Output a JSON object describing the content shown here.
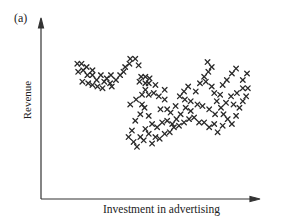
{
  "chart_data": {
    "type": "scatter",
    "title": "",
    "panel_label": "(a)",
    "xlabel": "Investment in advertising",
    "ylabel": "Revenue",
    "marker": "x",
    "grid": false,
    "legend": null,
    "axis_ticks": false,
    "xlim": [
      0,
      100
    ],
    "ylim": [
      0,
      100
    ],
    "points": [
      [
        23,
        83
      ],
      [
        28,
        83
      ],
      [
        34,
        81
      ],
      [
        41,
        79
      ],
      [
        24,
        78
      ],
      [
        30,
        79
      ],
      [
        35,
        76
      ],
      [
        41,
        76
      ],
      [
        29,
        72
      ],
      [
        36,
        71
      ],
      [
        41,
        70
      ],
      [
        46,
        73
      ],
      [
        51,
        76
      ],
      [
        47,
        69
      ],
      [
        53,
        68
      ],
      [
        55,
        72
      ],
      [
        58,
        74
      ],
      [
        62,
        71
      ],
      [
        64,
        69
      ],
      [
        63,
        76
      ],
      [
        69,
        73
      ],
      [
        74,
        76
      ],
      [
        78,
        78
      ],
      [
        80,
        81
      ],
      [
        85,
        83
      ],
      [
        86,
        86
      ],
      [
        92,
        86
      ],
      [
        96,
        82
      ],
      [
        99,
        75
      ],
      [
        97,
        72
      ],
      [
        104,
        75
      ],
      [
        104,
        71
      ],
      [
        109,
        74
      ],
      [
        108,
        71
      ],
      [
        104,
        67
      ],
      [
        116,
        70
      ],
      [
        100,
        64
      ],
      [
        108,
        64
      ],
      [
        114,
        65
      ],
      [
        120,
        63
      ],
      [
        127,
        67
      ],
      [
        127,
        61
      ],
      [
        122,
        55
      ],
      [
        130,
        55
      ],
      [
        134,
        53
      ],
      [
        140,
        57
      ],
      [
        145,
        63
      ],
      [
        150,
        66
      ],
      [
        155,
        69
      ],
      [
        151,
        61
      ],
      [
        158,
        60
      ],
      [
        164,
        66
      ],
      [
        169,
        71
      ],
      [
        174,
        75
      ],
      [
        179,
        78
      ],
      [
        183,
        81
      ],
      [
        178,
        84
      ],
      [
        176,
        72
      ],
      [
        183,
        69
      ],
      [
        186,
        65
      ],
      [
        189,
        60
      ],
      [
        193,
        64
      ],
      [
        196,
        70
      ],
      [
        201,
        73
      ],
      [
        207,
        77
      ],
      [
        212,
        80
      ],
      [
        220,
        73
      ],
      [
        225,
        77
      ],
      [
        220,
        68
      ],
      [
        226,
        68
      ],
      [
        213,
        65
      ],
      [
        206,
        63
      ],
      [
        200,
        59
      ],
      [
        194,
        56
      ],
      [
        187,
        52
      ],
      [
        180,
        55
      ],
      [
        172,
        57
      ],
      [
        166,
        58
      ],
      [
        158,
        54
      ],
      [
        152,
        56
      ],
      [
        146,
        52
      ],
      [
        141,
        49
      ],
      [
        136,
        46
      ],
      [
        130,
        48
      ],
      [
        124,
        47
      ],
      [
        118,
        44
      ],
      [
        112,
        46
      ],
      [
        108,
        51
      ],
      [
        103,
        56
      ],
      [
        98,
        52
      ],
      [
        92,
        48
      ],
      [
        88,
        42
      ],
      [
        84,
        38
      ],
      [
        90,
        35
      ],
      [
        94,
        32
      ],
      [
        98,
        38
      ],
      [
        104,
        43
      ],
      [
        102,
        36
      ],
      [
        108,
        40
      ],
      [
        112,
        34
      ],
      [
        116,
        38
      ],
      [
        121,
        37
      ],
      [
        127,
        40
      ],
      [
        133,
        41
      ],
      [
        138,
        44
      ],
      [
        144,
        45
      ],
      [
        150,
        47
      ],
      [
        156,
        49
      ],
      [
        162,
        50
      ],
      [
        168,
        47
      ],
      [
        174,
        47
      ],
      [
        180,
        44
      ],
      [
        186,
        46
      ],
      [
        190,
        41
      ],
      [
        196,
        45
      ],
      [
        202,
        49
      ],
      [
        207,
        46
      ],
      [
        212,
        51
      ],
      [
        216,
        56
      ],
      [
        220,
        60
      ],
      [
        224,
        63
      ],
      [
        209,
        58
      ],
      [
        197,
        52
      ],
      [
        86,
        58
      ],
      [
        93,
        61
      ],
      [
        100,
        58
      ]
    ]
  },
  "labels": {
    "panel": "(a)",
    "y_axis": "Revenue",
    "x_axis": "Investment in advertising"
  }
}
